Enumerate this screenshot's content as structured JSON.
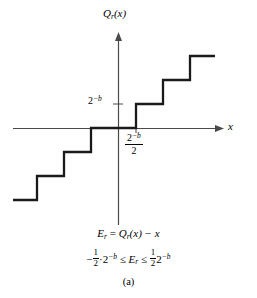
{
  "figure": {
    "caption": "(a)",
    "axis_labels": {
      "y_label_base": "Q",
      "y_label_sub": "r",
      "y_label_arg": "(x)",
      "x_label": "x"
    },
    "ticks": {
      "y_tick_base": "2",
      "y_tick_exp": "−b",
      "x_tick_num_base": "2",
      "x_tick_num_exp": "−b",
      "x_tick_den": "2"
    },
    "equations": {
      "eq1_lhs_base": "E",
      "eq1_lhs_sub": "r",
      "eq1_eq": " = ",
      "eq1_rhs_base": "Q",
      "eq1_rhs_sub": "r",
      "eq1_rhs_arg": "(x) − x",
      "eq2_minus": "−",
      "eq2_frac_num": "1",
      "eq2_frac_den": "2",
      "eq2_dot": "·",
      "eq2_pow_base": "2",
      "eq2_pow_exp": "−b",
      "eq2_le1": " ≤ ",
      "eq2_mid_base": "E",
      "eq2_mid_sub": "r",
      "eq2_le2": " ≤ ",
      "eq2_frac2_num": "1",
      "eq2_frac2_den": "2",
      "eq2_pow2_base": "2",
      "eq2_pow2_exp": "−b"
    },
    "colors": {
      "curve": "#1a1a1a",
      "axis": "#4a4a4a",
      "background": "#ffffff"
    }
  },
  "chart_data": {
    "type": "line",
    "title": "",
    "subtitle": "(a)",
    "xlabel": "x",
    "ylabel": "Q_r(x)",
    "grid": false,
    "legend": null,
    "axes": {
      "origin_px": [
        118,
        128
      ],
      "x_axis_px": {
        "x_start": 13,
        "x_end": 222,
        "y": 128,
        "arrow": "right"
      },
      "y_axis_px": {
        "y_start": 33,
        "y_end": 225,
        "x": 118,
        "arrow": "up"
      },
      "x_tick_values": [
        "2^-b/2"
      ],
      "y_tick_values": [
        "2^-b"
      ]
    },
    "step_geometry": {
      "step_width_px": 27,
      "step_height_px": 24,
      "note": "staircase is odd-symmetric about the origin"
    },
    "series": [
      {
        "name": "Q_r(x)",
        "kind": "staircase",
        "points_px": [
          [
            13,
            200
          ],
          [
            37,
            200
          ],
          [
            37,
            176
          ],
          [
            64,
            176
          ],
          [
            64,
            152
          ],
          [
            91,
            152
          ],
          [
            91,
            128
          ],
          [
            118,
            128
          ],
          [
            118,
            128
          ],
          [
            136,
            128
          ],
          [
            136,
            104
          ],
          [
            163,
            104
          ],
          [
            163,
            80
          ],
          [
            190,
            80
          ],
          [
            190,
            56
          ],
          [
            215,
            56
          ]
        ],
        "segments_data_units": [
          {
            "x_from": -3.5,
            "x_to": -2.5,
            "y": -3
          },
          {
            "x_from": -2.5,
            "x_to": -1.5,
            "y": -2
          },
          {
            "x_from": -1.5,
            "x_to": -0.5,
            "y": -1
          },
          {
            "x_from": -0.5,
            "x_to": 0.5,
            "y": 0
          },
          {
            "x_from": 0.5,
            "x_to": 1.5,
            "y": 1
          },
          {
            "x_from": 1.5,
            "x_to": 2.5,
            "y": 2
          },
          {
            "x_from": 2.5,
            "x_to": 3.5,
            "y": 3
          }
        ],
        "units": "x and y in multiples of 2^-b"
      }
    ],
    "annotations": [
      {
        "text": "E_r = Q_r(x) - x",
        "position": "below plot"
      },
      {
        "text": "-1/2 * 2^-b <= E_r <= 1/2 * 2^-b",
        "position": "below plot"
      }
    ]
  }
}
